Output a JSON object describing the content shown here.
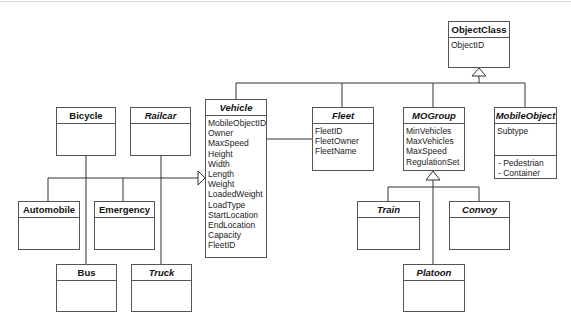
{
  "diagram": {
    "type": "uml-class-diagram",
    "classes": {
      "objectclass": {
        "name": "ObjectClass",
        "abstract": false,
        "attributes": [
          "ObjectID"
        ]
      },
      "vehicle": {
        "name": "Vehicle",
        "abstract": true,
        "attributes": [
          "MobileObjectID",
          "Owner",
          "MaxSpeed",
          "Height",
          "Width",
          "Length",
          "Weight",
          "LoadedWeight",
          "LoadType",
          "StartLocation",
          "EndLocation",
          "Capacity",
          "FleetID"
        ]
      },
      "fleet": {
        "name": "Fleet",
        "abstract": true,
        "attributes": [
          "FleetID",
          "FleetOwner",
          "FleetName"
        ]
      },
      "mogroup": {
        "name": "MOGroup",
        "abstract": true,
        "attributes": [
          "MinVehicles",
          "MaxVehicles",
          "MaxSpeed",
          "RegulationSet"
        ]
      },
      "mobileobject": {
        "name": "MobileObject",
        "abstract": true,
        "attributes": [
          "Subtype"
        ],
        "subtypes": [
          "- Pedestrian",
          "- Container"
        ]
      },
      "bicycle": {
        "name": "Bicycle",
        "abstract": false,
        "attributes": []
      },
      "railcar": {
        "name": "Railcar",
        "abstract": true,
        "attributes": []
      },
      "automobile": {
        "name": "Automobile",
        "abstract": false,
        "attributes": []
      },
      "emergency": {
        "name": "Emergency",
        "abstract": false,
        "attributes": []
      },
      "bus": {
        "name": "Bus",
        "abstract": false,
        "attributes": []
      },
      "truck": {
        "name": "Truck",
        "abstract": true,
        "attributes": []
      },
      "train": {
        "name": "Train",
        "abstract": true,
        "attributes": []
      },
      "convoy": {
        "name": "Convoy",
        "abstract": true,
        "attributes": []
      },
      "platoon": {
        "name": "Platoon",
        "abstract": true,
        "attributes": []
      }
    },
    "relationships": [
      {
        "type": "generalization",
        "parent": "ObjectClass",
        "children": [
          "Vehicle",
          "Fleet",
          "MOGroup",
          "MobileObject"
        ]
      },
      {
        "type": "generalization",
        "parent": "Vehicle",
        "children": [
          "Bicycle",
          "Railcar",
          "Automobile",
          "Emergency",
          "Bus",
          "Truck"
        ]
      },
      {
        "type": "generalization",
        "parent": "MOGroup",
        "children": [
          "Train",
          "Convoy",
          "Platoon"
        ]
      },
      {
        "type": "association",
        "ends": [
          "Vehicle",
          "Fleet"
        ]
      }
    ],
    "colors": {
      "line": "#333333",
      "border": "#555555",
      "background": "#ffffff"
    }
  }
}
